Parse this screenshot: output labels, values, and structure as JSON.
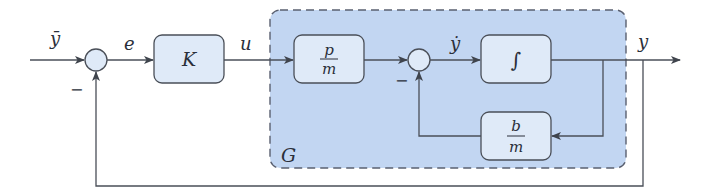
{
  "diagram": {
    "type": "block-diagram",
    "colors": {
      "line": "#4a4f58",
      "block_fill": "#dfeaf8",
      "block_stroke": "#4a4f58",
      "region_fill": "#c2d6f2",
      "region_stroke": "#5a6070",
      "sum_fill": "#dfeaf8"
    },
    "signals": {
      "reference": "ȳ",
      "error": "e",
      "control": "u",
      "velocity": "ẏ",
      "output": "y"
    },
    "sum_signs": {
      "outer_feedback": "−",
      "inner_feedback": "−"
    },
    "blocks": {
      "controller": {
        "label": "K"
      },
      "input_gain": {
        "numerator": "p",
        "denominator": "m"
      },
      "integrator": {
        "label": "∫"
      },
      "damping": {
        "numerator": "b",
        "denominator": "m"
      }
    },
    "region": {
      "label": "G"
    }
  }
}
